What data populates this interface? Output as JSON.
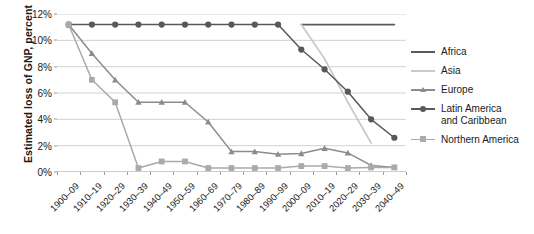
{
  "chart_data": {
    "type": "line",
    "title": "",
    "xlabel": "",
    "ylabel": "Estimated loss of GNP, percent",
    "ylim": [
      0,
      12
    ],
    "ytick_labels": [
      "0%",
      "2%",
      "4%",
      "6%",
      "8%",
      "10%",
      "12%"
    ],
    "ytick_values": [
      0,
      2,
      4,
      6,
      8,
      10,
      12
    ],
    "grid": "horizontal",
    "legend_position": "right",
    "categories": [
      "1900–09",
      "1910–19",
      "1920–29",
      "1930–39",
      "1940–49",
      "1950–59",
      "1960–69",
      "1970–79",
      "1980–89",
      "1990–99",
      "2000–09",
      "2010–19",
      "2020–29",
      "2030–39",
      "2040–49"
    ],
    "series": [
      {
        "name": "Africa",
        "color": "#5a5a5a",
        "marker": "none",
        "values": [
          null,
          null,
          null,
          null,
          null,
          null,
          null,
          null,
          null,
          null,
          11.2,
          11.2,
          11.2,
          11.2,
          11.2
        ]
      },
      {
        "name": "Asia",
        "color": "#c9c9c9",
        "marker": "none",
        "values": [
          null,
          null,
          null,
          null,
          null,
          null,
          null,
          null,
          null,
          null,
          11.2,
          8.6,
          5.3,
          2.2,
          null
        ]
      },
      {
        "name": "Europe",
        "color": "#8c8c8c",
        "marker": "triangle",
        "values": [
          11.2,
          9.0,
          7.0,
          5.3,
          5.3,
          5.3,
          3.8,
          1.55,
          1.55,
          1.35,
          1.4,
          1.8,
          1.45,
          0.5,
          0.35
        ]
      },
      {
        "name": "Latin America and Caribbean",
        "color": "#595959",
        "marker": "circle",
        "values": [
          11.2,
          11.2,
          11.2,
          11.2,
          11.2,
          11.2,
          11.2,
          11.2,
          11.2,
          11.2,
          9.3,
          7.8,
          6.1,
          4.0,
          2.6
        ]
      },
      {
        "name": "Northern America",
        "color": "#aaaaaa",
        "marker": "square",
        "values": [
          11.2,
          7.0,
          5.3,
          0.3,
          0.8,
          0.8,
          0.3,
          0.3,
          0.3,
          0.3,
          0.45,
          0.45,
          0.3,
          0.35,
          0.35
        ]
      }
    ],
    "legend": [
      {
        "label": "Africa",
        "label_line2": "",
        "color": "#5a5a5a",
        "marker": "none"
      },
      {
        "label": "Asia",
        "label_line2": "",
        "color": "#c9c9c9",
        "marker": "none"
      },
      {
        "label": "Europe",
        "label_line2": "",
        "color": "#8c8c8c",
        "marker": "triangle"
      },
      {
        "label": "Latin America",
        "label_line2": "and Caribbean",
        "color": "#595959",
        "marker": "circle"
      },
      {
        "label": "Northern America",
        "label_line2": "",
        "color": "#aaaaaa",
        "marker": "square"
      }
    ]
  }
}
